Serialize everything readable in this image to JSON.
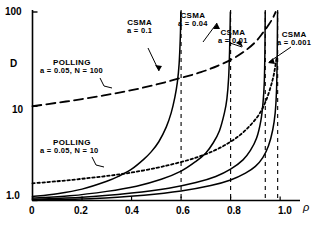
{
  "chart_data": {
    "type": "line",
    "title": "",
    "xlabel": "ρ",
    "ylabel": "D",
    "xlim": [
      0,
      1.06
    ],
    "ylim": [
      1.0,
      100
    ],
    "yscale": "log",
    "xscale": "linear",
    "grid": false,
    "legend": "annotations-inline",
    "xticks": [
      "0",
      "0.2",
      "0.4",
      "0.6",
      "0.8",
      "1.0"
    ],
    "xtick_values": [
      0,
      0.2,
      0.4,
      0.6,
      0.8,
      1.0
    ],
    "yticks": [
      "1.0",
      "10",
      "100"
    ],
    "ytick_values": [
      1.0,
      10,
      100
    ],
    "series": [
      {
        "name": "CSMA a = 0.1",
        "style": "solid",
        "asymptote": 0.6,
        "x": [
          0.0,
          0.1,
          0.2,
          0.3,
          0.35,
          0.4,
          0.45,
          0.48,
          0.51,
          0.54,
          0.56,
          0.575,
          0.585,
          0.592,
          0.597,
          0.599
        ],
        "y": [
          1.1,
          1.18,
          1.32,
          1.6,
          1.82,
          2.15,
          2.75,
          3.3,
          4.2,
          6.0,
          8.5,
          12.5,
          18.0,
          28.0,
          55.0,
          100.0
        ]
      },
      {
        "name": "CSMA a = 0.04",
        "style": "solid",
        "asymptote": 0.8,
        "x": [
          0.0,
          0.15,
          0.3,
          0.42,
          0.52,
          0.6,
          0.66,
          0.7,
          0.73,
          0.755,
          0.775,
          0.785,
          0.792,
          0.796,
          0.799
        ],
        "y": [
          1.06,
          1.12,
          1.25,
          1.42,
          1.68,
          2.05,
          2.6,
          3.2,
          4.1,
          5.5,
          8.5,
          12.0,
          20.0,
          40.0,
          100.0
        ]
      },
      {
        "name": "CSMA a = 0.01",
        "style": "solid",
        "asymptote": 0.94,
        "x": [
          0.0,
          0.2,
          0.4,
          0.55,
          0.66,
          0.74,
          0.8,
          0.85,
          0.88,
          0.905,
          0.922,
          0.931,
          0.936,
          0.9385,
          0.9398
        ],
        "y": [
          1.03,
          1.08,
          1.2,
          1.35,
          1.55,
          1.8,
          2.15,
          2.7,
          3.4,
          4.6,
          7.0,
          11.0,
          18.0,
          38.0,
          100.0
        ]
      },
      {
        "name": "CSMA a = 0.001",
        "style": "solid",
        "asymptote": 0.99,
        "x": [
          0.0,
          0.25,
          0.45,
          0.6,
          0.72,
          0.8,
          0.86,
          0.9,
          0.93,
          0.953,
          0.97,
          0.98,
          0.9855,
          0.988,
          0.9895
        ],
        "y": [
          1.01,
          1.05,
          1.14,
          1.26,
          1.44,
          1.65,
          1.95,
          2.3,
          2.85,
          3.8,
          5.6,
          8.5,
          15.0,
          32.0,
          100.0
        ]
      },
      {
        "name": "POLLING a = 0.05, N = 100",
        "style": "dashed",
        "asymptote": 1.0,
        "x": [
          0.0,
          0.1,
          0.2,
          0.3,
          0.4,
          0.5,
          0.6,
          0.68,
          0.75,
          0.81,
          0.86,
          0.9,
          0.93,
          0.955,
          0.972,
          0.982
        ],
        "y": [
          10.0,
          10.9,
          11.9,
          13.2,
          14.8,
          17.0,
          20.0,
          23.0,
          27.0,
          32.0,
          39.0,
          48.0,
          60.0,
          74.0,
          88.0,
          100.0
        ]
      },
      {
        "name": "POLLING a = 0.05, N = 10",
        "style": "dotted",
        "asymptote": 1.0,
        "x": [
          0.0,
          0.1,
          0.2,
          0.3,
          0.4,
          0.5,
          0.58,
          0.66,
          0.73,
          0.79,
          0.84,
          0.88,
          0.915,
          0.94,
          0.96,
          0.975,
          0.985
        ],
        "y": [
          1.52,
          1.6,
          1.7,
          1.82,
          1.98,
          2.22,
          2.48,
          2.85,
          3.35,
          4.05,
          5.0,
          6.3,
          8.2,
          11.0,
          15.5,
          22.0,
          32.0
        ]
      }
    ],
    "annotations": [
      {
        "name": "csma-a-0.1",
        "line1": "CSMA",
        "line2": "a = 0.1"
      },
      {
        "name": "csma-a-0.04",
        "line1": "CSMA",
        "line2": "a = 0.04"
      },
      {
        "name": "csma-a-0.01",
        "line1": "CSMA",
        "line2": "a = 0.01"
      },
      {
        "name": "csma-a-0.001",
        "line1": "CSMA",
        "line2": "a = 0.001"
      },
      {
        "name": "polling-n-100",
        "line1": "POLLING",
        "line2": "a = 0.05, N = 100"
      },
      {
        "name": "polling-n-10",
        "line1": "POLLING",
        "line2": "a = 0.05, N = 10"
      }
    ],
    "colors": {
      "ink": "#000000",
      "background": "#ffffff"
    }
  },
  "axes": {
    "y_label": "D",
    "x_label": "ρ",
    "y_ticks": [
      {
        "text": "100"
      },
      {
        "text": "10"
      },
      {
        "text": "1.0"
      }
    ],
    "x_ticks": [
      {
        "text": "0"
      },
      {
        "text": "0.2"
      },
      {
        "text": "0.4"
      },
      {
        "text": "0.6"
      },
      {
        "text": "0.8"
      },
      {
        "text": "1.0"
      }
    ]
  },
  "annotations": {
    "csma_01": {
      "line1": "CSMA",
      "line2": "a = 0.1"
    },
    "csma_004": {
      "line1": "CSMA",
      "line2": "a = 0.04"
    },
    "csma_001": {
      "line1": "CSMA",
      "line2": "a = 0.01"
    },
    "csma_0001": {
      "line1": "CSMA",
      "line2": "a = 0.001"
    },
    "polling_100": {
      "line1": "POLLING",
      "line2": "a = 0.05, N = 100"
    },
    "polling_10": {
      "line1": "POLLING",
      "line2": "a = 0.05, N = 10"
    }
  }
}
